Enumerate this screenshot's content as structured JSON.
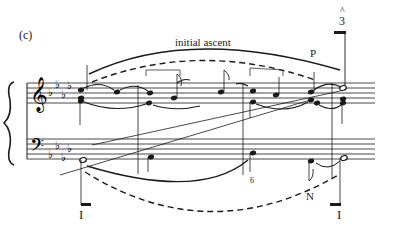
{
  "figure": {
    "panel_label": "(c)",
    "type": "Schenkerian voice-leading graph",
    "annotations": {
      "top_slur_label": "initial ascent",
      "passing_tone_label": "P",
      "scale_degree": "3",
      "scale_degree_caret": "^",
      "figured_bass": "6",
      "neighbor_label": "N",
      "roman_numeral_left": "I",
      "roman_numeral_right": "I"
    },
    "staves": [
      {
        "clef": "treble",
        "key_signature": "4 flats"
      },
      {
        "clef": "bass",
        "key_signature": "4 flats"
      }
    ]
  }
}
